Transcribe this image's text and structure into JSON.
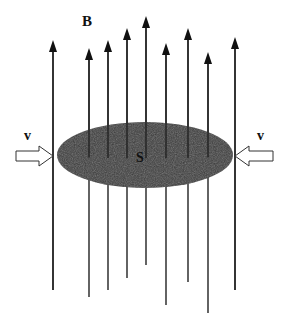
{
  "figure": {
    "labels": {
      "field": "B",
      "surface": "S",
      "velocity_left": "v",
      "velocity_right": "v"
    },
    "colors": {
      "surface_fill": "#3a3a3a",
      "line": "#222222",
      "background": "#ffffff"
    },
    "surface": {
      "cx": 145,
      "cy": 155,
      "rx": 88,
      "ry": 33
    },
    "field_lines": [
      {
        "x": 53,
        "top": 40,
        "bottom": 290
      },
      {
        "x": 89,
        "top": 48,
        "bottom": 297
      },
      {
        "x": 108,
        "top": 40,
        "bottom": 290
      },
      {
        "x": 127,
        "top": 28,
        "bottom": 278
      },
      {
        "x": 146,
        "top": 16,
        "bottom": 265
      },
      {
        "x": 166,
        "top": 43,
        "bottom": 305
      },
      {
        "x": 188,
        "top": 28,
        "bottom": 282
      },
      {
        "x": 208,
        "top": 52,
        "bottom": 313
      },
      {
        "x": 235,
        "top": 37,
        "bottom": 290
      }
    ],
    "velocity_arrows": [
      {
        "side": "left",
        "direction": "right",
        "tip_x": 53,
        "y": 156
      },
      {
        "side": "right",
        "direction": "left",
        "tip_x": 235,
        "y": 156
      }
    ]
  }
}
